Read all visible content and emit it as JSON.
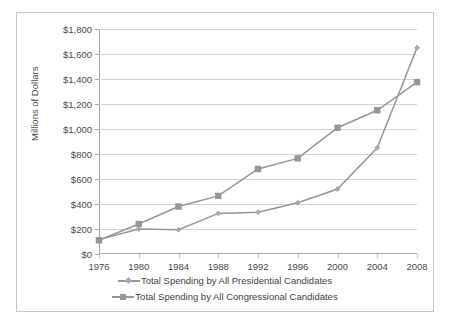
{
  "chart": {
    "ylabel": "Millions of Dollars",
    "yticks": [
      "$0",
      "$200",
      "$400",
      "$600",
      "$800",
      "$1,000",
      "$1,200",
      "$1,400",
      "$1,600",
      "$1,800"
    ],
    "xticks": [
      "1976",
      "1980",
      "1984",
      "1988",
      "1992",
      "1996",
      "2000",
      "2004",
      "2008"
    ],
    "legend": [
      {
        "label": "Total Spending by All Presidential Candidates",
        "marker": "diamond-marker-icon",
        "color": "#969696"
      },
      {
        "label": "Total Spending by All Congressional Candidates",
        "marker": "square-marker-icon",
        "color": "#969696"
      }
    ]
  },
  "chart_data": {
    "type": "line",
    "title": "",
    "subtitle": "",
    "xlabel": "",
    "ylabel": "Millions of Dollars",
    "x": [
      1976,
      1980,
      1984,
      1988,
      1992,
      1996,
      2000,
      2004,
      2008
    ],
    "categories": [
      "1976",
      "1980",
      "1984",
      "1988",
      "1992",
      "1996",
      "2000",
      "2004",
      "2008"
    ],
    "series": [
      {
        "name": "Total Spending by All Presidential Candidates",
        "color": "#969696",
        "marker": "diamond",
        "values": [
          115,
          200,
          195,
          325,
          335,
          410,
          520,
          850,
          1650
        ]
      },
      {
        "name": "Total Spending by All Congressional Candidates",
        "color": "#969696",
        "marker": "square",
        "values": [
          110,
          240,
          380,
          465,
          680,
          765,
          1010,
          1150,
          1375
        ]
      }
    ],
    "ylim": [
      0,
      1800
    ],
    "ytick_values": [
      0,
      200,
      400,
      600,
      800,
      1000,
      1200,
      1400,
      1600,
      1800
    ],
    "yticklabels": [
      "$0",
      "$200",
      "$400",
      "$600",
      "$800",
      "$1,000",
      "$1,200",
      "$1,400",
      "$1,600",
      "$1,800"
    ],
    "xlim": [
      1976,
      2008
    ],
    "grid": "horizontal",
    "legend_position": "bottom",
    "annotations": []
  }
}
